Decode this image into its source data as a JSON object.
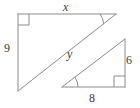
{
  "figure": {
    "kind": "similar-right-triangles-diagram",
    "stroke_color": "#8c8c8c",
    "label_color": "#3a3a3a",
    "background_color": "#ffffff",
    "width": 140,
    "height": 108,
    "labels": {
      "top_side": "x",
      "left_side": "9",
      "hypotenuse_large": "y",
      "right_side_small": "6",
      "base_small": "8"
    },
    "shapes": [
      {
        "name": "large-triangle",
        "vertices": [
          [
            18,
            14
          ],
          [
            116,
            14
          ],
          [
            18,
            91
          ]
        ],
        "right_angle_at": [
          18,
          14
        ],
        "marked_angle_at": [
          116,
          14
        ],
        "side_labels": {
          "top": "x",
          "left": "9",
          "hypotenuse": "y"
        }
      },
      {
        "name": "small-triangle",
        "vertices": [
          [
            62,
            87
          ],
          [
            125,
            87
          ],
          [
            125,
            39
          ]
        ],
        "right_angle_at": [
          125,
          87
        ],
        "marked_angle_at": [
          62,
          87
        ],
        "side_labels": {
          "base": "8",
          "right": "6"
        }
      }
    ]
  }
}
